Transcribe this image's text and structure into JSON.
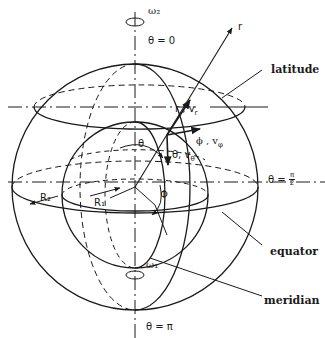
{
  "diagram": {
    "type": "spherical-coordinate-system",
    "colors": {
      "line": "#1a1a1a",
      "background": "#ffffff"
    },
    "labels": {
      "omega_top": "ω₂",
      "omega_bottom": "ω₁",
      "theta_zero": "θ = 0",
      "theta_half_pi_prefix": "θ =",
      "theta_half_pi_num": "π",
      "theta_half_pi_den": "2",
      "theta_pi": "θ = π",
      "r_axis": "r",
      "r_vector": "r , v",
      "r_vector_sub": "r",
      "phi_vector": "ϕ , v",
      "phi_vector_sub": "φ",
      "theta_vector": "θ, v",
      "theta_vector_sub": "θ",
      "theta_angle": "θ",
      "phi_angle": "Φ",
      "R1": "R₁",
      "R2": "R₂"
    },
    "callouts": {
      "latitude": "latitude",
      "equator": "equator",
      "meridian": "meridian"
    }
  }
}
